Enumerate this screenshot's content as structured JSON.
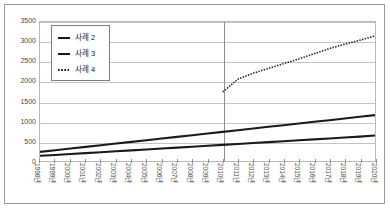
{
  "figure": {
    "title": "",
    "background_color": "#ffffff",
    "frame_color": "#9a9a9a"
  },
  "legend": {
    "position": "top-left-inside",
    "entries": [
      {
        "label": "사례 2",
        "marker": "solid-line-swatch",
        "color": "#1a1a1a",
        "style": "solid"
      },
      {
        "label": "사례 3",
        "marker": "solid-line-swatch",
        "color": "#1a1a1a",
        "style": "solid"
      },
      {
        "label": "사례 4",
        "marker": "dotted-line-swatch",
        "color": "#1a1a1a",
        "style": "dotted"
      }
    ]
  },
  "chart_data": {
    "type": "line",
    "title": "",
    "subtitle": "",
    "xlabel": "",
    "ylabel": "",
    "grid": true,
    "legend_position": "top-left-inside",
    "ylim": [
      0,
      3500
    ],
    "ytick_labels": [
      "0",
      "500",
      "1000",
      "1500",
      "2000",
      "2500",
      "3000",
      "3500"
    ],
    "ytick_values": [
      0,
      500,
      1000,
      1500,
      2000,
      2500,
      3000,
      3500
    ],
    "x": [
      "1998년",
      "1999년",
      "2000년",
      "2001년",
      "2002년",
      "2003년",
      "2004년",
      "2005년",
      "2006년",
      "2007년",
      "2008년",
      "2009년",
      "2010년",
      "2011년",
      "2012년",
      "2013년",
      "2014년",
      "2015년",
      "2016년",
      "2017년",
      "2018년",
      "2019년",
      "2020년"
    ],
    "annotations": [
      {
        "type": "vertical-line",
        "at_x": "2010년",
        "color": "#8e8e8e",
        "label": ""
      }
    ],
    "series": [
      {
        "name": "사례 2",
        "style": "solid",
        "color": "#1a1a1a",
        "values": [
          230,
          272,
          314,
          356,
          398,
          440,
          482,
          524,
          566,
          608,
          650,
          692,
          734,
          776,
          818,
          860,
          902,
          944,
          986,
          1028,
          1070,
          1112,
          1155
        ]
      },
      {
        "name": "사례 3",
        "style": "solid",
        "color": "#1a1a1a",
        "values": [
          130,
          153,
          176,
          199,
          222,
          245,
          268,
          291,
          314,
          337,
          360,
          383,
          406,
          429,
          452,
          475,
          498,
          521,
          544,
          567,
          590,
          613,
          640
        ]
      },
      {
        "name": "사례 4",
        "style": "dotted",
        "color": "#1a1a1a",
        "values": [
          null,
          null,
          null,
          null,
          null,
          null,
          null,
          null,
          null,
          null,
          null,
          null,
          1740,
          2060,
          2210,
          2330,
          2450,
          2570,
          2700,
          2830,
          2940,
          3040,
          3150
        ]
      }
    ]
  }
}
